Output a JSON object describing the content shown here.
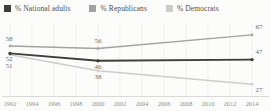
{
  "legend": {
    "items": [
      {
        "label": "% National adults",
        "color": "#3d3d3d"
      },
      {
        "label": "% Republicans",
        "color": "#a2a2a2"
      },
      {
        "label": "% Democrats",
        "color": "#cdcdcd"
      }
    ]
  },
  "chart_data": {
    "type": "line",
    "title": "",
    "xlabel": "",
    "ylabel": "%",
    "x": [
      1992,
      2000,
      2014
    ],
    "series": [
      {
        "name": "National adults",
        "legend_label": "% National adults",
        "color": "#3d3d3d",
        "values": [
          52,
          46,
          47
        ],
        "label_side": [
          "below",
          "below",
          "above"
        ]
      },
      {
        "name": "Republicans",
        "legend_label": "% Republicans",
        "color": "#a2a2a2",
        "values": [
          58,
          56,
          67
        ],
        "label_side": [
          "above",
          "above",
          "above"
        ]
      },
      {
        "name": "Democrats",
        "legend_label": "% Democrats",
        "color": "#cdcdcd",
        "values": [
          51,
          38,
          27
        ],
        "label_side": [
          "below",
          "below",
          "below"
        ]
      }
    ],
    "x_tick_labels": [
      "1992",
      "1994",
      "1996",
      "1998",
      "2000",
      "2002",
      "2004",
      "2006",
      "2008",
      "2010",
      "2012",
      "2014"
    ],
    "xlim": [
      1992,
      2014
    ],
    "ylim": [
      20,
      75
    ],
    "grid": "vertical-faint",
    "legend_position": "top",
    "point_labels_shown": true,
    "colors": {
      "background": "#fcfcfb",
      "axis_line": "#cfcfcf",
      "gridline": "#ececec",
      "value_label_text": "#6e6e6e",
      "tick_label_text": "#8f8f8f"
    }
  }
}
